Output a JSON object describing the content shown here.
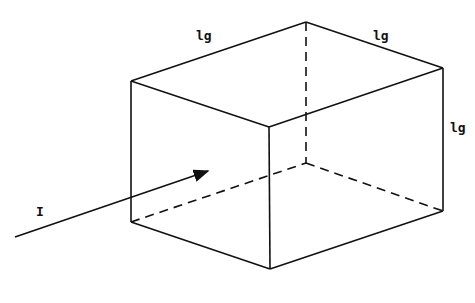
{
  "diagram": {
    "edge_labels": {
      "top_left_edge": "lg",
      "top_right_edge": "lg",
      "right_vertical_edge": "lg"
    },
    "beam_label": "I",
    "line_color": "#111111"
  }
}
